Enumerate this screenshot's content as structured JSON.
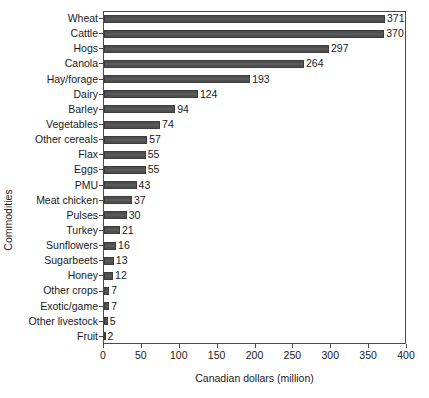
{
  "chart_data": {
    "type": "bar",
    "orientation": "horizontal",
    "title": "",
    "xlabel": "Canadian dollars (million)",
    "ylabel": "Commodities",
    "xlim": [
      0,
      400
    ],
    "xticks": [
      0,
      50,
      100,
      150,
      200,
      250,
      300,
      350,
      400
    ],
    "xtick_labels": [
      "0",
      "50",
      "100",
      "150",
      "200",
      "250",
      "300",
      "350",
      "400"
    ],
    "grid": false,
    "legend": null,
    "bar_color": "#4f4f4f",
    "bar_edge_color": "#3c3c3c",
    "axis_color": "#4a4a4a",
    "categories": [
      "Wheat",
      "Cattle",
      "Hogs",
      "Canola",
      "Hay/forage",
      "Dairy",
      "Barley",
      "Vegetables",
      "Other cereals",
      "Flax",
      "Eggs",
      "PMU",
      "Meat chicken",
      "Pulses",
      "Turkey",
      "Sunflowers",
      "Sugarbeets",
      "Honey",
      "Other crops",
      "Exotic/game",
      "Other livestock",
      "Fruit"
    ],
    "values": [
      371,
      370,
      297,
      264,
      193,
      124,
      94,
      74,
      57,
      55,
      55,
      43,
      37,
      30,
      21,
      16,
      13,
      12,
      7,
      7,
      5,
      2
    ],
    "data_labels": [
      "371",
      "370",
      "297",
      "264",
      "193",
      "124",
      "94",
      "74",
      "57",
      "55",
      "55",
      "43",
      "37",
      "30",
      "21",
      "16",
      "13",
      "12",
      "7",
      "7",
      "5",
      "2"
    ]
  }
}
